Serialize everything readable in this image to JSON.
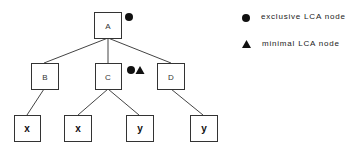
{
  "tree": {
    "nodes": [
      {
        "id": "A",
        "label": "A",
        "markers": [
          "exclusive"
        ]
      },
      {
        "id": "B",
        "label": "B",
        "markers": []
      },
      {
        "id": "C",
        "label": "C",
        "markers": [
          "exclusive",
          "minimal"
        ]
      },
      {
        "id": "D",
        "label": "D",
        "markers": []
      },
      {
        "id": "x1",
        "label": "x",
        "markers": []
      },
      {
        "id": "x2",
        "label": "x",
        "markers": []
      },
      {
        "id": "y1",
        "label": "y",
        "markers": []
      },
      {
        "id": "y2",
        "label": "y",
        "markers": []
      }
    ],
    "edges": [
      [
        "A",
        "B"
      ],
      [
        "A",
        "C"
      ],
      [
        "A",
        "D"
      ],
      [
        "B",
        "x1"
      ],
      [
        "C",
        "x2"
      ],
      [
        "C",
        "y1"
      ],
      [
        "D",
        "y2"
      ]
    ]
  },
  "legend": {
    "exclusive": "exclusive LCA node",
    "minimal": "minimal LCA node"
  }
}
